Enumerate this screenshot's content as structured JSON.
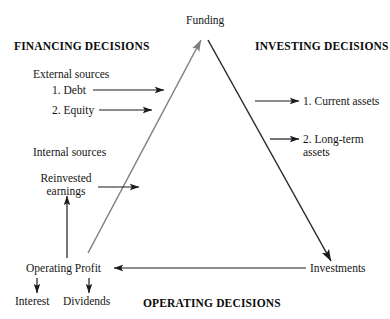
{
  "diagram": {
    "title_apex": "Funding",
    "headings": {
      "financing": "FINANCING DECISIONS",
      "investing": "INVESTING DECISIONS",
      "operating": "OPERATING DECISIONS"
    },
    "financing": {
      "external_label": "External sources",
      "external_items": [
        "1. Debt",
        "2. Equity"
      ],
      "internal_label": "Internal sources",
      "internal_items": [
        "Reinvested\nearnings"
      ]
    },
    "investing": {
      "items": [
        "1. Current assets",
        "2. Long-term\nassets"
      ]
    },
    "operating": {
      "profit_label": "Operating Profit",
      "outflows": [
        "Interest",
        "Dividends"
      ],
      "investments_label": "Investments"
    },
    "colors": {
      "funding_edge": "#808080",
      "investing_edge": "#2b2b2b",
      "arrow": "#1a1a1a",
      "text": "#151515",
      "background": "#ffffff"
    }
  }
}
